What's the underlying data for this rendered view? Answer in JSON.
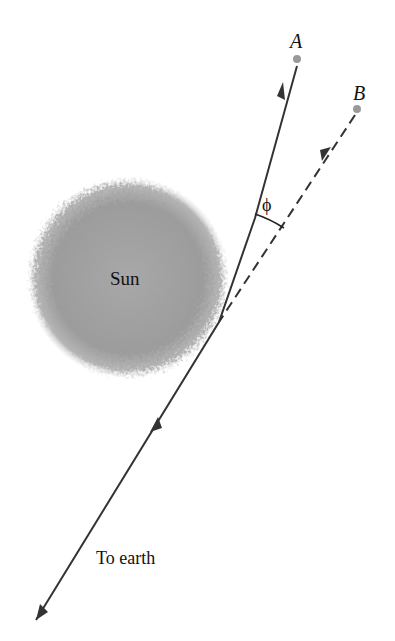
{
  "diagram": {
    "labels": {
      "point_a": "A",
      "point_b": "B",
      "sun": "Sun",
      "angle": "ϕ",
      "destination": "To earth"
    },
    "colors": {
      "line": "#333333",
      "point": "#999999",
      "sun": "#9a9a9a"
    },
    "elements": [
      {
        "name": "actual-light-path",
        "from": "A",
        "bend_near": "Sun limb",
        "to": "To earth",
        "style": "solid"
      },
      {
        "name": "apparent-light-path",
        "from": "B",
        "to": "Sun limb",
        "style": "dashed"
      },
      {
        "name": "deflection-angle",
        "label": "ϕ",
        "between": [
          "actual-light-path",
          "apparent-light-path"
        ]
      }
    ]
  }
}
